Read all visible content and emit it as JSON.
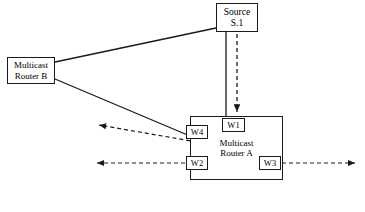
{
  "diagram": {
    "background_color": "#ffffff",
    "line_color": "#1a1a1a",
    "nodes": [
      {
        "id": "source",
        "label_line1": "Source",
        "label_line2": "S.1",
        "x": 216,
        "y": 3,
        "w": 42,
        "h": 29
      },
      {
        "id": "router_b",
        "label_line1": "Multicast",
        "label_line2": "Router B",
        "x": 7,
        "y": 57,
        "w": 48,
        "h": 27
      },
      {
        "id": "router_a",
        "label_line1": "Multicast",
        "label_line2": "Router A",
        "x": 190,
        "y": 116,
        "w": 93,
        "h": 64
      }
    ],
    "ports": [
      {
        "id": "w1",
        "label": "W1",
        "x": 222,
        "y": 118,
        "w": 23,
        "h": 14
      },
      {
        "id": "w4",
        "label": "W4",
        "x": 186,
        "y": 125,
        "w": 22,
        "h": 14
      },
      {
        "id": "w2",
        "label": "W2",
        "x": 186,
        "y": 156,
        "w": 22,
        "h": 14
      },
      {
        "id": "w3",
        "label": "W3",
        "x": 259,
        "y": 156,
        "w": 22,
        "h": 14
      }
    ],
    "solid_links": [
      {
        "id": "router-b-to-source",
        "from": "router_b",
        "to": "source",
        "x1": 55,
        "y1": 62,
        "x2": 216,
        "y2": 28
      },
      {
        "id": "router-b-to-w4",
        "from": "router_b",
        "to": "w4",
        "x1": 55,
        "y1": 79,
        "x2": 196,
        "y2": 139
      },
      {
        "id": "source-to-router-a",
        "from": "source",
        "to": "router_a",
        "x1": 226,
        "y1": 32,
        "x2": 226,
        "y2": 116
      }
    ],
    "dashed_flows": [
      {
        "id": "flow-source-to-w1",
        "from": "source",
        "to": "w1",
        "x1": 237,
        "y1": 34,
        "x2": 237,
        "y2": 115,
        "direction": "down"
      },
      {
        "id": "flow-w4-outbound",
        "from": "w4",
        "to": "external-left-upper",
        "x1": 196,
        "y1": 141,
        "x2": 96,
        "y2": 124,
        "direction": "left"
      },
      {
        "id": "flow-w2-outbound",
        "from": "w2",
        "to": "external-left-lower",
        "x1": 185,
        "y1": 163,
        "x2": 94,
        "y2": 163,
        "direction": "left"
      },
      {
        "id": "flow-w3-outbound",
        "from": "w3",
        "to": "external-right",
        "x1": 282,
        "y1": 163,
        "x2": 358,
        "y2": 163,
        "direction": "right"
      }
    ]
  }
}
